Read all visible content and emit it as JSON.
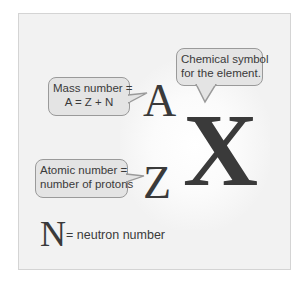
{
  "diagram": {
    "symbols": {
      "mass_number": "A",
      "atomic_number": "Z",
      "element": "X",
      "neutron": "N"
    },
    "callouts": {
      "mass_number": {
        "line1": "Mass number =",
        "line2": "A = Z + N"
      },
      "chemical_symbol": {
        "line1": "Chemical symbol",
        "line2": "for the element."
      },
      "atomic_number": {
        "line1": "Atomic number =",
        "line2": "number of protons"
      }
    },
    "legend": {
      "neutron_text": "= neutron number"
    },
    "colors": {
      "panel_bg": "#f2f2f2",
      "callout_bg": "#e4e4e4",
      "callout_border": "#9a9a9a",
      "text": "#3a3a3a"
    }
  }
}
